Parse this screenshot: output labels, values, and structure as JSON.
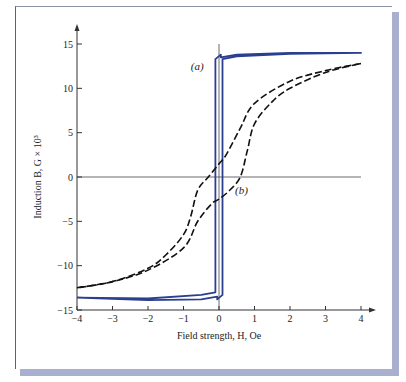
{
  "chart_data": {
    "type": "line",
    "title": "",
    "xlabel": "Field strength, H, Oe",
    "ylabel": "Induction B, G × 10³",
    "xlim": [
      -4,
      4
    ],
    "ylim": [
      -15,
      15
    ],
    "x_ticks": [
      "−4",
      "−3",
      "−2",
      "−1",
      "0",
      "1",
      "2",
      "3",
      "4"
    ],
    "y_ticks": [
      "15",
      "10",
      "5",
      "0",
      "−5",
      "−10",
      "−15"
    ],
    "grid": false,
    "legend": null,
    "annotations": [
      {
        "text": "(a)",
        "x": -0.4,
        "y": 12.5
      },
      {
        "text": "(b)",
        "x": 0.45,
        "y": -1.5
      }
    ],
    "series": [
      {
        "name": "(a) square hysteresis loop",
        "style": "solid",
        "color": "#2a3f8f",
        "x": [
          -4,
          -2,
          -0.5,
          -0.1,
          -0.1,
          0.05,
          0.05,
          0.5,
          2,
          4,
          4,
          2,
          0.5,
          0.1,
          0.1,
          -0.05,
          -0.05,
          -0.5,
          -2,
          -4
        ],
        "y": [
          -13.6,
          -13.7,
          -13.3,
          -13.0,
          13.3,
          13.8,
          13.5,
          13.8,
          14.0,
          14.0,
          14.0,
          13.9,
          13.6,
          13.3,
          -13.3,
          -13.8,
          -13.5,
          -13.8,
          -13.9,
          -13.6
        ]
      },
      {
        "name": "(b) soft loop, ascending branch",
        "style": "dashed",
        "color": "#111111",
        "x": [
          -4,
          -3,
          -2,
          -1,
          -0.6,
          -0.2,
          0,
          0.3,
          0.6,
          0.8,
          1.0,
          1.5,
          2,
          3,
          4
        ],
        "y": [
          -12.5,
          -11.8,
          -10.5,
          -8,
          -5,
          -3,
          -2.5,
          -1.5,
          0,
          3,
          6,
          8.5,
          10,
          11.8,
          12.8
        ]
      },
      {
        "name": "(b) soft loop, descending branch",
        "style": "dashed",
        "color": "#111111",
        "x": [
          4,
          3,
          2,
          1,
          0.6,
          0.2,
          0,
          -0.3,
          -0.6,
          -0.8,
          -1.0,
          -1.5,
          -2,
          -3,
          -4
        ],
        "y": [
          12.8,
          12.0,
          10.8,
          8.3,
          5.5,
          2.5,
          1.5,
          0,
          -1.5,
          -4.5,
          -6.5,
          -8.8,
          -10.3,
          -11.8,
          -12.5
        ]
      }
    ]
  }
}
